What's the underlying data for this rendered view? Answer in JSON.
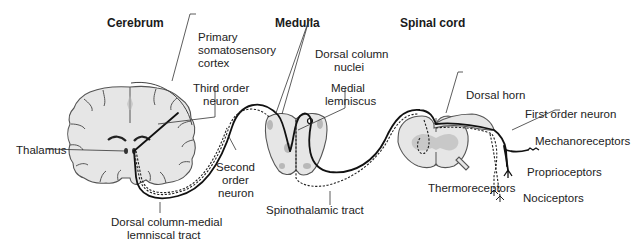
{
  "figure": {
    "type": "anatomical-diagram"
  },
  "sections": [
    {
      "id": "cerebrum",
      "label": "Cerebrum"
    },
    {
      "id": "medulla",
      "label": "Medulla"
    },
    {
      "id": "spinal_cord",
      "label": "Spinal cord"
    }
  ],
  "labels": {
    "primary_cortex": [
      "Primary",
      "somatosensory",
      "cortex"
    ],
    "third_order_neuron": [
      "Third order",
      "neuron"
    ],
    "thalamus": "Thalamus",
    "second_order_neuron": [
      "Second",
      "order",
      "neuron"
    ],
    "dorsal_column_medial_lemniscal": [
      "Dorsal column-medial",
      "lemniscal tract"
    ],
    "dorsal_column_nuclei": [
      "Dorsal column",
      "nuclei"
    ],
    "medial_lemniscus": [
      "Medial",
      "lemniscus"
    ],
    "spinothalamic_tract": "Spinothalamic tract",
    "dorsal_horn": "Dorsal horn",
    "first_order_neuron": "First order neuron",
    "mechanoreceptors": "Mechanoreceptors",
    "proprioceptors": "Proprioceptors",
    "thermoreceptors": "Thermoreceptors",
    "nociceptors": "Nociceptors"
  },
  "legend_encoding": {
    "solid_line": "Dorsal column-medial lemniscal tract",
    "dashed_line": "Spinothalamic tract"
  },
  "colors": {
    "tissue_fill": "#e6e6e6",
    "grey_matter": "#b8b8b8",
    "outline": "#555555",
    "pathway": "#111111"
  }
}
